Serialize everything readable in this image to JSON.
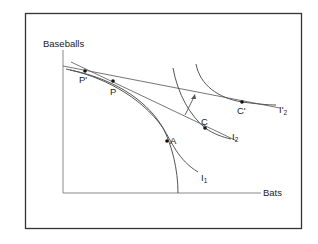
{
  "diagram": {
    "y_axis_label": "Baseballs",
    "x_axis_label": "Bats",
    "points": {
      "p_prime": "P'",
      "p": "P",
      "a": "A",
      "c": "C",
      "c_prime": "C'"
    },
    "curves": {
      "i1": {
        "base": "I",
        "sub": "1"
      },
      "i2": {
        "base": "I",
        "sub": "2"
      },
      "i2_prime": {
        "base": "I'",
        "sub": "2"
      }
    },
    "colors": {
      "frame": "#333333",
      "axis": "#888888",
      "curve": "#555555",
      "point": "#111111"
    }
  }
}
